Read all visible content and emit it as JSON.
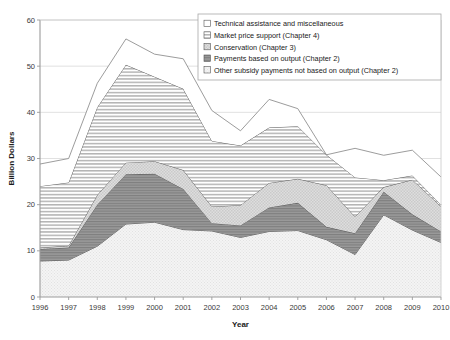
{
  "chart_data": {
    "type": "area",
    "stacked": true,
    "title": "",
    "xlabel": "Year",
    "ylabel": "Billion Dollars",
    "categories": [
      1996,
      1997,
      1998,
      1999,
      2000,
      2001,
      2002,
      2003,
      2004,
      2005,
      2006,
      2007,
      2008,
      2009,
      2010
    ],
    "x": [
      "1996",
      "1997",
      "1998",
      "1999",
      "2000",
      "2001",
      "2002",
      "2003",
      "2004",
      "2005",
      "2006",
      "2007",
      "2008",
      "2009",
      "2010"
    ],
    "xlim": [
      1996,
      2010
    ],
    "ylim": [
      0,
      60
    ],
    "yticks": [
      0,
      10,
      20,
      30,
      40,
      50,
      60
    ],
    "ytick_labels": [
      "0",
      "10",
      "20",
      "30",
      "40",
      "50",
      "60"
    ],
    "grid": "horizontal",
    "legend_position": "top-right",
    "series": [
      {
        "name": "Other subsidy payments not based on output (Chapter 2)",
        "pattern": "fine-dot-light",
        "fill": "#f2f2f2",
        "values": [
          7.8,
          8.0,
          11.0,
          15.8,
          16.2,
          14.6,
          14.3,
          12.9,
          14.2,
          14.4,
          12.4,
          9.2,
          17.8,
          14.5,
          11.8
        ]
      },
      {
        "name": "Payments based on output (Chapter 2)",
        "pattern": "dark-gray-horizontal",
        "fill": "#8f8f8f",
        "values": [
          2.6,
          2.7,
          9.0,
          10.8,
          10.5,
          8.8,
          1.7,
          2.6,
          5.2,
          6.0,
          2.8,
          4.6,
          5.0,
          3.4,
          2.4
        ]
      },
      {
        "name": "Conservation (Chapter 3)",
        "pattern": "light-checker",
        "fill": "#dcdcdc",
        "values": [
          0.3,
          0.4,
          2.1,
          2.5,
          2.7,
          4.1,
          3.6,
          4.4,
          5.3,
          5.2,
          9.0,
          3.6,
          1.0,
          7.5,
          5.4
        ]
      },
      {
        "name": "Market price support (Chapter 4)",
        "pattern": "horizontal-lines",
        "fill": "#c8c8c8",
        "values": [
          13.3,
          13.7,
          19.0,
          21.2,
          18.3,
          17.6,
          14.2,
          12.9,
          12.0,
          11.4,
          6.6,
          8.5,
          1.5,
          0.9,
          0.4
        ]
      },
      {
        "name": "Technical assistance and miscellaneous",
        "pattern": "plain-white",
        "fill": "#ffffff",
        "values": [
          4.8,
          5.2,
          5.2,
          5.6,
          4.9,
          6.5,
          6.6,
          3.2,
          6.1,
          3.8,
          0.0,
          6.3,
          5.4,
          5.5,
          6.0
        ]
      }
    ],
    "stack_order_bottom_to_top": [
      "Other subsidy payments not based on output (Chapter 2)",
      "Payments based on output (Chapter 2)",
      "Conservation (Chapter 3)",
      "Market price support (Chapter 4)",
      "Technical assistance and miscellaneous"
    ],
    "legend_entries": [
      "Technical assistance and miscellaneous",
      "Market price support (Chapter 4)",
      "Conservation (Chapter 3)",
      "Payments based on output (Chapter 2)",
      "Other subsidy payments not based on output (Chapter 2)"
    ],
    "cumulative_totals": [
      28.8,
      30.0,
      46.3,
      55.9,
      52.6,
      51.6,
      40.4,
      36.0,
      42.8,
      40.8,
      30.8,
      32.2,
      30.7,
      31.8,
      26.0
    ]
  },
  "axes": {
    "y_title": "Billion Dollars",
    "x_title": "Year"
  }
}
